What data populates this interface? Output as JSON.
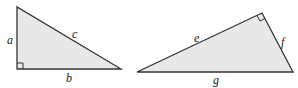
{
  "diagram": {
    "fill_color": "#e8e8e8",
    "stroke_color": "#333333",
    "triangle_left": {
      "labels": {
        "a": "a",
        "b": "b",
        "c": "c"
      }
    },
    "triangle_right": {
      "labels": {
        "e": "e",
        "f": "f",
        "g": "g"
      }
    }
  }
}
